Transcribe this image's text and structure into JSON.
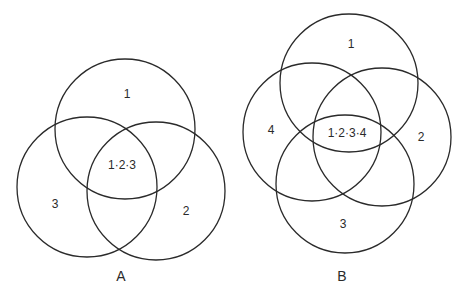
{
  "diagram_a": {
    "caption": "A",
    "circles": [
      {
        "id": "1",
        "cx": 125,
        "cy": 129,
        "r": 70
      },
      {
        "id": "2",
        "cx": 156,
        "cy": 191,
        "r": 69
      },
      {
        "id": "3",
        "cx": 87,
        "cy": 187,
        "r": 70
      }
    ],
    "labels": {
      "set1": "1",
      "set2": "2",
      "set3": "3",
      "intersection": "1·2·3"
    }
  },
  "diagram_b": {
    "caption": "B",
    "circles": [
      {
        "id": "1",
        "cx": 349,
        "cy": 83,
        "r": 69
      },
      {
        "id": "2",
        "cx": 382,
        "cy": 137,
        "r": 69
      },
      {
        "id": "3",
        "cx": 345,
        "cy": 184,
        "r": 69
      },
      {
        "id": "4",
        "cx": 312,
        "cy": 132,
        "r": 69
      }
    ],
    "labels": {
      "set1": "1",
      "set2": "2",
      "set3": "3",
      "set4": "4",
      "intersection": "1·2·3·4"
    }
  }
}
